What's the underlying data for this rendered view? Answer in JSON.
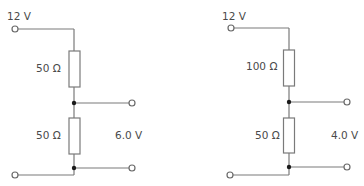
{
  "diagram": {
    "type": "voltage-divider-circuits",
    "colors": {
      "wire": "#7a7a7a",
      "text": "#4a4a4a",
      "junction": "#1a1a1a",
      "background": "#ffffff"
    },
    "circuits": [
      {
        "name": "left",
        "input_label": "12 V",
        "r_top_label": "50 Ω",
        "r_bottom_label": "50 Ω",
        "output_label": "6.0 V"
      },
      {
        "name": "right",
        "input_label": "12 V",
        "r_top_label": "100 Ω",
        "r_bottom_label": "50 Ω",
        "output_label": "4.0 V"
      }
    ]
  }
}
